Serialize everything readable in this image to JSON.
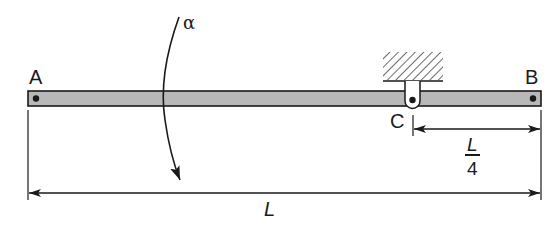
{
  "diagram": {
    "type": "beam-with-pin-support",
    "labels": {
      "end_left": "A",
      "end_right": "B",
      "support": "C",
      "angular_accel": "α",
      "total_length": "L",
      "support_offset_num": "L",
      "support_offset_den": "4"
    },
    "colors": {
      "beam_fill": "#b8b8b8",
      "ink": "#1a1a1a",
      "background": "#ffffff"
    },
    "elements": [
      {
        "name": "beam",
        "description": "Horizontal uniform bar from A to B"
      },
      {
        "name": "pin-A",
        "description": "Dot at left end A"
      },
      {
        "name": "pin-B",
        "description": "Dot at right end B"
      },
      {
        "name": "support-C",
        "description": "Pin hanger attached to hatched fixed ceiling, located L/4 from B"
      },
      {
        "name": "alpha-arrow",
        "description": "Curved arrow indicating angular acceleration α, pointing downward"
      },
      {
        "name": "dimension-L",
        "description": "Dimension line spanning full length A to B"
      },
      {
        "name": "dimension-L4",
        "description": "Dimension line from C to B, labeled L/4"
      }
    ]
  }
}
